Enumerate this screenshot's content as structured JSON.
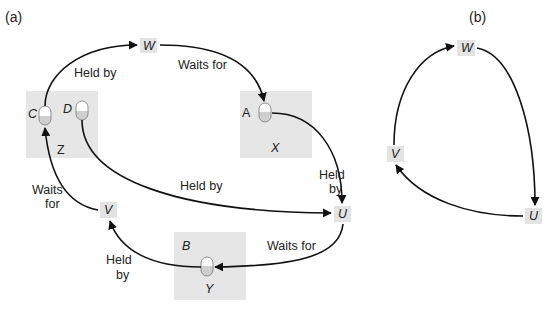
{
  "panels": {
    "a": {
      "label": "(a)",
      "sites": [
        {
          "name": "Z",
          "objects": [
            "C",
            "D"
          ]
        },
        {
          "name": "X",
          "objects": [
            "A"
          ]
        },
        {
          "name": "Y",
          "objects": [
            "B"
          ]
        }
      ],
      "processes": [
        "W",
        "U",
        "V"
      ],
      "objects": {
        "C": "C",
        "D": "D",
        "A": "A",
        "B": "B"
      },
      "site_labels": {
        "Z": "Z",
        "X": "X",
        "Y": "Y"
      },
      "process_labels": {
        "W": "W",
        "U": "U",
        "V": "V"
      },
      "edge_labels": {
        "c_to_w": "Held by",
        "w_to_a": "Waits for",
        "d_to_u": "Held by",
        "a_to_u_line1": "Held",
        "a_to_u_line2": "by",
        "u_to_b": "Waits for",
        "b_to_v_line1": "Held",
        "b_to_v_line2": "by",
        "v_to_c_line1": "Waits",
        "v_to_c_line2": "for"
      },
      "edges": [
        {
          "from": "C",
          "to": "W",
          "label": "Held by"
        },
        {
          "from": "W",
          "to": "A",
          "label": "Waits for"
        },
        {
          "from": "A",
          "to": "U",
          "label": "Held by"
        },
        {
          "from": "D",
          "to": "U",
          "label": "Held by"
        },
        {
          "from": "U",
          "to": "B",
          "label": "Waits for"
        },
        {
          "from": "B",
          "to": "V",
          "label": "Held by"
        },
        {
          "from": "V",
          "to": "C",
          "label": "Waits for"
        }
      ]
    },
    "b": {
      "label": "(b)",
      "processes": {
        "W": "W",
        "U": "U",
        "V": "V"
      },
      "edges": [
        {
          "from": "V",
          "to": "W"
        },
        {
          "from": "W",
          "to": "U"
        },
        {
          "from": "U",
          "to": "V"
        }
      ]
    }
  },
  "colors": {
    "site_fill": "#e6e6e6",
    "process_fill": "#e3e3e3",
    "cylinder_top": "#ffffff",
    "cylinder_bottom": "#cfcfcf",
    "edge": "#111111"
  }
}
